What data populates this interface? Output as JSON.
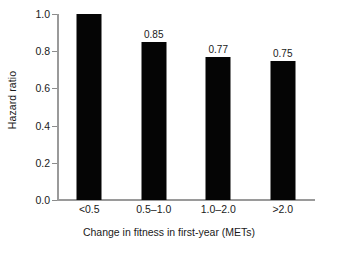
{
  "chart_data": {
    "type": "bar",
    "title": "",
    "subtitle": "",
    "xlabel": "Change in fitness in first-year (METs)",
    "ylabel": "Hazard ratio",
    "categories": [
      "<0.5",
      "0.5–1.0",
      "1.0–2.0",
      ">2.0"
    ],
    "values": [
      1.0,
      0.85,
      0.77,
      0.75
    ],
    "data_labels": [
      "",
      "0.85",
      "0.77",
      "0.75"
    ],
    "ylim": [
      0.0,
      1.0
    ],
    "xlim": null,
    "ytick_labels": [
      "0.0",
      "0.2",
      "0.4",
      "0.6",
      "0.8",
      "1.0"
    ],
    "ytick_values": [
      0.0,
      0.2,
      0.4,
      0.6,
      0.8,
      1.0
    ],
    "grid": false,
    "legend": null,
    "legend_position": "none",
    "bar_color": "#050505",
    "axis_color": "#9a9a9a",
    "text_color": "#1a1a1a",
    "background_color": "#ffffff",
    "annotations": []
  }
}
